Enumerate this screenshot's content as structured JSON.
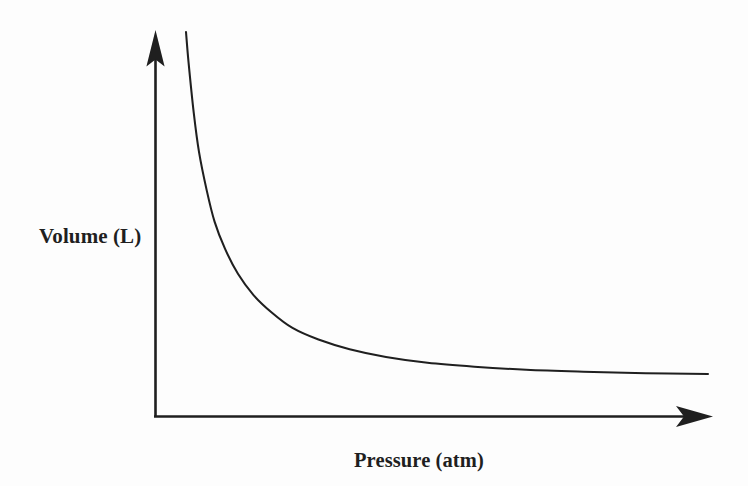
{
  "figure": {
    "width": 748,
    "height": 486,
    "background_color": "#fdfdfd",
    "ink_color": "#1f1f1f"
  },
  "labels": {
    "y_axis": "Volume (L)",
    "x_axis": "Pressure (atm)",
    "title": ""
  },
  "chart_data": {
    "type": "line",
    "title": "",
    "subtitle": "",
    "xlabel": "Pressure (atm)",
    "ylabel": "Volume (L)",
    "relationship": "inverse",
    "equation": "P x V = k",
    "grid": false,
    "legend": null,
    "legend_position": "none",
    "axis_ticks": false,
    "tick_labels": [],
    "axis_arrows": true,
    "xlim": [
      0,
      10
    ],
    "ylim": [
      0,
      10
    ],
    "x": [
      0.55,
      0.6,
      0.7,
      0.8,
      0.95,
      1.1,
      1.3,
      1.55,
      1.85,
      2.2,
      2.6,
      3.1,
      3.7,
      4.4,
      5.2,
      6.1,
      7.1,
      8.2,
      9.4,
      10.6
    ],
    "values": [
      9.7,
      8.9,
      7.6,
      6.6,
      5.6,
      4.8,
      4.1,
      3.45,
      2.9,
      2.45,
      2.05,
      1.75,
      1.5,
      1.3,
      1.15,
      1.05,
      0.97,
      0.92,
      0.88,
      0.86
    ],
    "series": [
      {
        "name": "Volume vs Pressure",
        "values": [
          9.7,
          8.9,
          7.6,
          6.6,
          5.6,
          4.8,
          4.1,
          3.45,
          2.9,
          2.45,
          2.05,
          1.75,
          1.5,
          1.3,
          1.15,
          1.05,
          0.97,
          0.92,
          0.88,
          0.86
        ],
        "color": "#1f1f1f"
      }
    ]
  },
  "geometry": {
    "origin": {
      "x": 155,
      "y": 417
    },
    "y_axis_top": {
      "x": 155,
      "y": 31
    },
    "x_axis_right": {
      "x": 712,
      "y": 417
    },
    "curve_start": {
      "x": 186,
      "y": 32
    },
    "curve_end": {
      "x": 708,
      "y": 374
    },
    "curve_path": "M 186 32 C 191 78 195 108 201 136 C 208 170 216 200 227 228 C 241 263 258 292 279 316 C 303 343 331 364 363 380 C 400 399 443 411 490 419 C 545 428 613 432 676 433"
  }
}
